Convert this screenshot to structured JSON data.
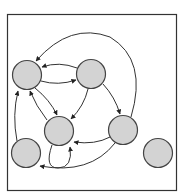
{
  "diagram": {
    "type": "directed-graph",
    "frame": {
      "x": 7.5,
      "y": 14.5,
      "width": 169,
      "height": 176,
      "stroke": "#333333"
    },
    "style": {
      "node_fill": "#d3d3d3",
      "node_stroke": "#444444",
      "edge_stroke": "#333333",
      "node_radius": 14.5
    },
    "nodes": [
      {
        "id": "A",
        "cx": 27,
        "cy": 75
      },
      {
        "id": "B",
        "cx": 91,
        "cy": 74
      },
      {
        "id": "C",
        "cx": 59,
        "cy": 131
      },
      {
        "id": "D",
        "cx": 123,
        "cy": 130
      },
      {
        "id": "E",
        "cx": 26,
        "cy": 153
      },
      {
        "id": "F",
        "cx": 158,
        "cy": 153
      }
    ],
    "edges": [
      {
        "from": "B",
        "to": "A",
        "path": "M 77 68 Q 59 61 42 67"
      },
      {
        "from": "A",
        "to": "B",
        "path": "M 41 81 Q 58 86 76 80"
      },
      {
        "from": "A",
        "to": "C",
        "path": "M 35 88 Q 50 100 57 115"
      },
      {
        "from": "C",
        "to": "A",
        "path": "M 47 120 Q 36 106 30 91"
      },
      {
        "from": "B",
        "to": "C",
        "path": "M 88 89 Q 84 106 71 119"
      },
      {
        "from": "B",
        "to": "D",
        "path": "M 103 84 Q 115 97 120 114"
      },
      {
        "from": "D",
        "to": "C",
        "path": "M 110 137 Q 95 145 74 142"
      },
      {
        "from": "D",
        "to": "E",
        "path": "M 115 143 Q 90 175 40 166"
      },
      {
        "from": "E",
        "to": "A",
        "path": "M 17 141 Q 12 115 18 91"
      },
      {
        "from": "D",
        "to": "A",
        "path": "M 131 117 Q 148 60 110 37 Q 70 22 36 61"
      },
      {
        "from": "C",
        "to": "C",
        "path": "M 52 145 Q 44 168 58 168 Q 73 168 70 147"
      }
    ]
  }
}
